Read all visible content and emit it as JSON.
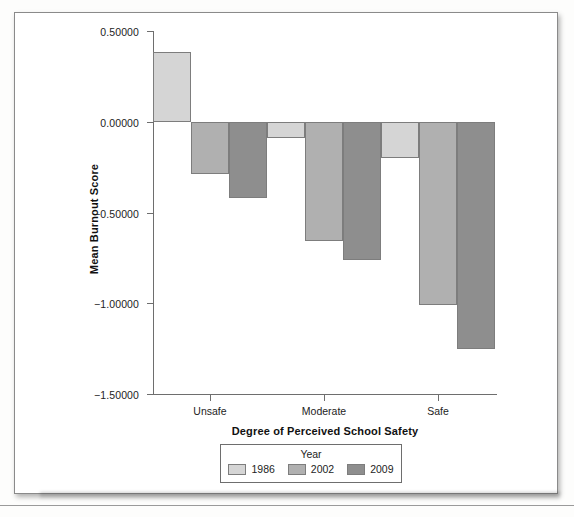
{
  "chart_data": {
    "type": "bar",
    "title": "",
    "xlabel": "Degree of Perceived School Safety",
    "ylabel": "Mean Burnout Score",
    "categories": [
      "Unsafe",
      "Moderate",
      "Safe"
    ],
    "series": [
      {
        "name": "1986",
        "color": "#d5d5d5",
        "values": [
          0.385,
          -0.09,
          -0.2
        ]
      },
      {
        "name": "2002",
        "color": "#b0b0b0",
        "values": [
          -0.29,
          -0.655,
          -1.01
        ]
      },
      {
        "name": "2009",
        "color": "#8e8e8e",
        "values": [
          -0.42,
          -0.76,
          -1.25
        ]
      }
    ],
    "legend_title": "Year",
    "legend_position": "bottom",
    "grid": false,
    "ylim": [
      -1.5,
      0.5
    ],
    "y_ticks": [
      0.5,
      0.0,
      -0.5,
      -1.0,
      -1.5
    ],
    "y_tick_labels": [
      "0.50000",
      "0.00000",
      "−0.50000",
      "−1.00000",
      "−1.50000"
    ],
    "x_tick_labels": [
      "Unsafe",
      "Moderate",
      "Safe"
    ],
    "zero_line": 0.0
  },
  "figure": {
    "frame_color": "#8a8a8a",
    "axis_color": "#6e6e6e",
    "text_color": "#1d1d1d",
    "background": "#ffffff"
  }
}
